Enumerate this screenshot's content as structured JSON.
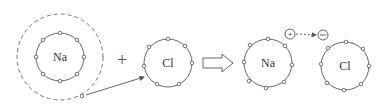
{
  "diagram": {
    "title": "",
    "colors": {
      "stroke": "#555555",
      "text": "#333333",
      "background": "#ffffff"
    },
    "atoms": [
      {
        "id": "na-before",
        "label": "Na",
        "electrons_outer_ring": 8,
        "has_dashed_valence_shell": true,
        "valence_electrons": 1
      },
      {
        "id": "cl-before",
        "label": "Cl",
        "electrons_outer_ring": 7
      },
      {
        "id": "na-after",
        "label": "Na",
        "electrons_outer_ring": 8
      },
      {
        "id": "cl-after",
        "label": "Cl",
        "electrons_outer_ring": 8
      }
    ],
    "operators": {
      "plus": "+",
      "reaction_arrow": "hollow-right-arrow"
    },
    "charges": {
      "positive": "+",
      "negative": "−"
    },
    "annotations": {
      "electron_transfer": "Na valence electron → Cl",
      "ion_attraction": "+ → −"
    }
  }
}
